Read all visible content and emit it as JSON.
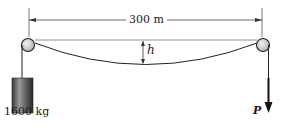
{
  "figure": {
    "span_label": "300 m",
    "sag_label": "h",
    "mass_label": "1600 kg",
    "force_label": "P"
  },
  "colors": {
    "line": "#222222",
    "pulley_fill": "#d8d8d8",
    "mass_dark": "#2a2a2a",
    "mass_light": "#8a8a8a",
    "background": "#ffffff"
  }
}
